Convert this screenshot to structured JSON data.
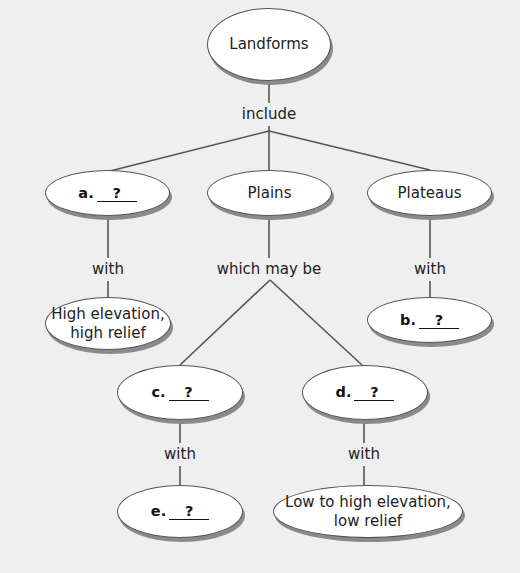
{
  "diagram": {
    "type": "concept-map",
    "root": {
      "label": "Landforms"
    },
    "root_link": "include",
    "level1": [
      {
        "id": "a",
        "letter": "a.",
        "blank": "?"
      },
      {
        "id": "plains",
        "label": "Plains"
      },
      {
        "id": "plateaus",
        "label": "Plateaus"
      }
    ],
    "links": {
      "a_with": "with",
      "plains_which": "which may be",
      "plateaus_with": "with",
      "c_with": "with",
      "d_with": "with"
    },
    "level2": {
      "a_child": {
        "label_line1": "High elevation,",
        "label_line2": "high relief"
      },
      "plateaus_child": {
        "letter": "b.",
        "blank": "?"
      },
      "plains_child_c": {
        "letter": "c.",
        "blank": "?"
      },
      "plains_child_d": {
        "letter": "d.",
        "blank": "?"
      }
    },
    "level3": {
      "c_child": {
        "letter": "e.",
        "blank": "?"
      },
      "d_child": {
        "label_line1": "Low to high elevation,",
        "label_line2": "low relief"
      }
    },
    "colors": {
      "background": "#efefef",
      "node_fill": "#ffffff",
      "node_border": "#555555",
      "node_shadow": "#8a8a8a",
      "line": "#555555",
      "text": "#222222"
    }
  }
}
